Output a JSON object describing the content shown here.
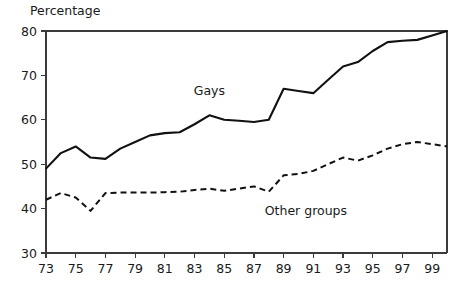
{
  "chart_data": {
    "type": "line",
    "title": "Percentage",
    "xlabel": "",
    "ylabel": "",
    "grid": false,
    "legend_position": "inline-annotations",
    "xlim": [
      73,
      100
    ],
    "ylim": [
      30,
      80
    ],
    "y_ticks": [
      30,
      40,
      50,
      60,
      70,
      80
    ],
    "y_tick_labels": [
      "30",
      "40",
      "50",
      "60",
      "70",
      "80"
    ],
    "x_ticks": [
      73,
      75,
      77,
      79,
      81,
      83,
      85,
      87,
      89,
      91,
      93,
      95,
      97,
      99
    ],
    "x_tick_labels": [
      "73",
      "75",
      "77",
      "79",
      "81",
      "83",
      "85",
      "87",
      "89",
      "91",
      "93",
      "95",
      "97",
      "99"
    ],
    "x": [
      73,
      74,
      75,
      76,
      77,
      78,
      79,
      80,
      81,
      82,
      83,
      84,
      85,
      86,
      87,
      88,
      89,
      90,
      91,
      92,
      93,
      94,
      95,
      96,
      97,
      98,
      99,
      100
    ],
    "series": [
      {
        "name": "Gays",
        "style": "solid",
        "label": "Gays",
        "label_x": 84,
        "label_y": 65.5,
        "values": [
          49.0,
          52.5,
          54.0,
          51.5,
          51.2,
          53.5,
          55.0,
          56.5,
          57.0,
          57.2,
          59.0,
          61.0,
          60.0,
          59.8,
          59.5,
          60.0,
          67.0,
          66.5,
          66.0,
          69.0,
          72.0,
          73.0,
          75.5,
          77.5,
          77.8,
          78.0,
          79.0,
          80.0
        ]
      },
      {
        "name": "Other groups",
        "style": "dashed",
        "label": "Other groups",
        "label_x": 90.5,
        "label_y": 38.5,
        "values": [
          42.0,
          43.5,
          42.5,
          39.5,
          43.5,
          43.6,
          43.6,
          43.6,
          43.7,
          43.8,
          44.2,
          44.5,
          44.0,
          44.5,
          45.0,
          43.8,
          47.5,
          47.8,
          48.5,
          50.0,
          51.5,
          50.8,
          52.0,
          53.5,
          54.5,
          55.0,
          54.5,
          54.0
        ]
      }
    ],
    "annotations": [
      {
        "text": "Gays",
        "series": "Gays"
      },
      {
        "text": "Other groups",
        "series": "Other groups"
      }
    ]
  },
  "colors": {
    "line": "#111111",
    "axis": "#3b3b3b",
    "background": "#ffffff"
  }
}
